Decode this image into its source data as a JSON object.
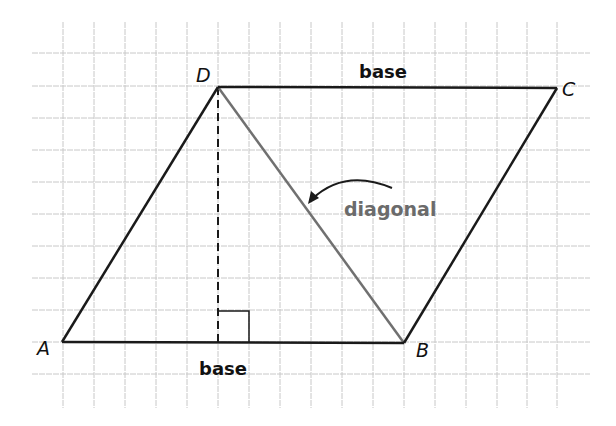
{
  "figure": {
    "type": "parallelogram-diagram",
    "grid": {
      "x_lines": [
        63,
        94,
        125,
        156,
        187,
        218,
        249,
        280,
        311,
        342,
        373,
        404,
        435,
        466,
        497,
        527,
        557
      ],
      "y_lines": [
        53,
        86,
        118,
        150,
        182,
        214,
        246,
        278,
        310,
        342,
        374
      ],
      "x_extent": [
        32,
        590
      ],
      "y_extent": [
        22,
        408
      ],
      "color": "#c8c8c8"
    },
    "vertices": {
      "A": {
        "label": "A",
        "x": 62,
        "y": 342
      },
      "B": {
        "label": "B",
        "x": 404,
        "y": 343
      },
      "C": {
        "label": "C",
        "x": 557,
        "y": 88
      },
      "D": {
        "label": "D",
        "x": 218,
        "y": 87
      }
    },
    "labels": {
      "base_top": "base",
      "base_bottom": "base",
      "diagonal": "diagonal"
    },
    "colors": {
      "sides": "#1a1a1a",
      "diagonal": "#707070",
      "diagonal_text": "#6b6b6b",
      "height_dash": "#1a1a1a"
    },
    "height_segment": {
      "from": "D",
      "foot_x": 218,
      "foot_y": 342,
      "style": "dashed"
    },
    "right_angle_marker": {
      "x": 218,
      "y": 311,
      "size": 31
    }
  }
}
